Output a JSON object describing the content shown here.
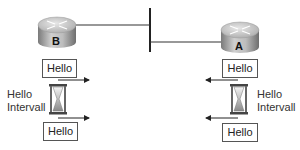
{
  "routers": [
    {
      "id": "B",
      "label": "B"
    },
    {
      "id": "A",
      "label": "A"
    }
  ],
  "left": {
    "hello_top": "Hello",
    "hello_bottom": "Hello",
    "interval_line1": "Hello",
    "interval_line2": "Intervall"
  },
  "right": {
    "hello_top": "Hello",
    "hello_bottom": "Hello",
    "interval_line1": "Hello",
    "interval_line2": "Intervall"
  },
  "colors": {
    "router_top": "#d8d8d8",
    "router_side": "#8a8a8a",
    "line": "#222222"
  }
}
